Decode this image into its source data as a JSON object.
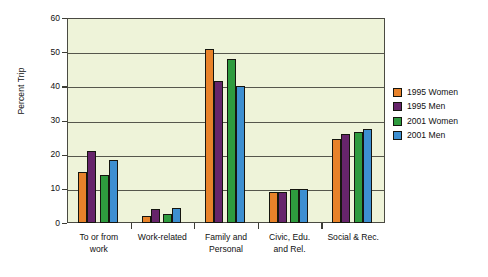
{
  "chart_data": {
    "type": "bar",
    "title": "",
    "subtitle": "",
    "xlabel": "",
    "ylabel": "Percent Trip",
    "ylim": [
      0,
      60
    ],
    "yticks": [
      0,
      10,
      20,
      30,
      40,
      50,
      60
    ],
    "ytick_labels": [
      "0",
      "10",
      "20",
      "30",
      "40",
      "50",
      "60"
    ],
    "grid": true,
    "grid_axis": "y",
    "legend_position": "right-outside",
    "categories": [
      "To or from work",
      "Work-related",
      "Family and Personal",
      "Civic, Edu. and Rel.",
      "Social & Rec."
    ],
    "category_label_lines": [
      [
        "To or from",
        "work"
      ],
      [
        "Work-related"
      ],
      [
        "Family and",
        "Personal"
      ],
      [
        "Civic, Edu.",
        "and Rel."
      ],
      [
        "Social & Rec."
      ]
    ],
    "series": [
      {
        "name": "1995 Women",
        "color": "#e8822a",
        "values": [
          15,
          2,
          51,
          9,
          24.5
        ]
      },
      {
        "name": "1995 Men",
        "color": "#66246b",
        "values": [
          21,
          4,
          41.5,
          9,
          26
        ]
      },
      {
        "name": "2001 Women",
        "color": "#2e9b3e",
        "values": [
          14,
          2.5,
          48,
          10,
          26.5
        ]
      },
      {
        "name": "2001 Men",
        "color": "#3d8fd1",
        "values": [
          18.5,
          4.5,
          40,
          10,
          27.5
        ]
      }
    ],
    "plot_background_color": "#eef3d9",
    "plot_border_color": "#4a4a42",
    "bar_outline_color": "#15150f"
  },
  "legend": {
    "items": [
      {
        "label": "1995 Women",
        "color": "#e8822a"
      },
      {
        "label": "1995 Men",
        "color": "#66246b"
      },
      {
        "label": "2001 Women",
        "color": "#2e9b3e"
      },
      {
        "label": "2001 Men",
        "color": "#3d8fd1"
      }
    ]
  }
}
